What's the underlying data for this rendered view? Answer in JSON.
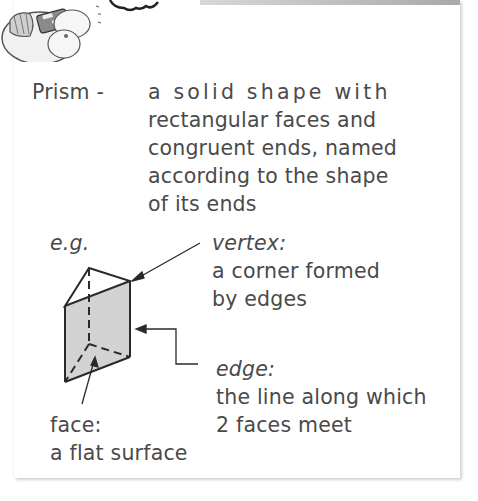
{
  "header": {
    "mascot_icon": "cartoon-character-with-calculator",
    "bubble_icon": "speech-bubble"
  },
  "definition": {
    "term": "Prism -",
    "lines": [
      "a solid shape with",
      "rectangular faces and",
      "congruent ends, named",
      "according to the shape",
      "of its ends"
    ]
  },
  "example": {
    "label": "e.g.",
    "figure": "triangular-prism",
    "annotations": {
      "vertex": {
        "title": "vertex:",
        "lines": [
          "a corner formed",
          "by edges"
        ]
      },
      "edge": {
        "title": "edge:",
        "lines": [
          "the line along which",
          "2 faces meet"
        ]
      },
      "face": {
        "title": "face:",
        "lines": [
          "a flat surface"
        ]
      }
    }
  },
  "colors": {
    "text": "#4a4a4a",
    "face_fill": "#d3d3d3",
    "line": "#2a2a2a"
  }
}
